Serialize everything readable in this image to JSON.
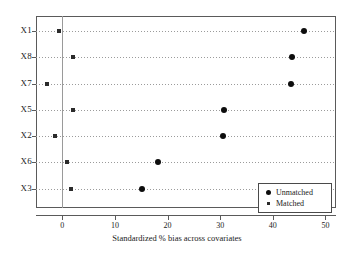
{
  "chart_data": {
    "type": "scatter",
    "title": "",
    "xlabel": "Standardized % bias across covariates",
    "ylabel": "",
    "xlim": [
      -5,
      52
    ],
    "ylim": [
      0,
      8
    ],
    "grid": true,
    "legend_position": "bottom-right",
    "xticks": [
      "0",
      "10",
      "20",
      "30",
      "40",
      "50"
    ],
    "xtick_values": [
      0,
      10,
      20,
      30,
      40,
      50
    ],
    "categories": [
      "X1",
      "X8",
      "X7",
      "X5",
      "X2",
      "X6",
      "X3"
    ],
    "series": [
      {
        "name": "Unmatched",
        "marker": "filled-circle",
        "color": "#0d0d0d",
        "values": [
          46.0,
          43.7,
          43.5,
          30.8,
          30.6,
          18.1,
          15.1
        ]
      },
      {
        "name": "Matched",
        "marker": "small-square",
        "color": "#2b2b2b",
        "values": [
          -0.7,
          2.0,
          -3.0,
          2.0,
          -1.3,
          0.9,
          1.7
        ]
      }
    ],
    "zero_reference_line": 0
  },
  "legend": {
    "items": [
      {
        "label": "Unmatched",
        "marker": "filled-circle"
      },
      {
        "label": "Matched",
        "marker": "small-square"
      }
    ]
  },
  "axis": {
    "x_title": "Standardized % bias across covariates"
  }
}
